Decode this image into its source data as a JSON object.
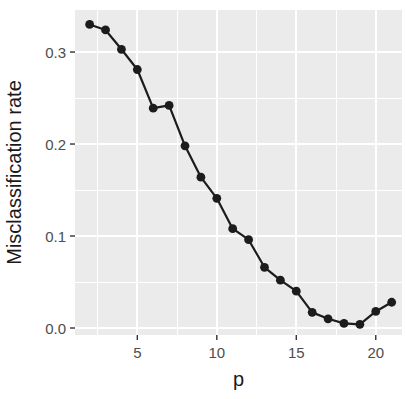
{
  "chart_data": {
    "type": "line",
    "xlabel": "p",
    "ylabel": "Misclassification rate",
    "x": [
      2,
      3,
      4,
      5,
      6,
      7,
      8,
      9,
      10,
      11,
      12,
      13,
      14,
      15,
      16,
      17,
      18,
      19,
      20,
      21
    ],
    "y": [
      0.33,
      0.324,
      0.303,
      0.281,
      0.239,
      0.242,
      0.198,
      0.164,
      0.141,
      0.108,
      0.096,
      0.066,
      0.052,
      0.04,
      0.017,
      0.01,
      0.005,
      0.004,
      0.018,
      0.028
    ],
    "x_ticks": [
      5,
      10,
      15,
      20
    ],
    "x_tick_labels": [
      "5",
      "10",
      "15",
      "20"
    ],
    "y_ticks": [
      0.0,
      0.1,
      0.2,
      0.3
    ],
    "y_tick_labels": [
      "0.0",
      "0.1",
      "0.2",
      "0.3"
    ],
    "x_minor_ticks": [
      2.5,
      7.5,
      12.5,
      17.5
    ],
    "y_minor_ticks": [
      0.05,
      0.15,
      0.25
    ],
    "xlim": [
      1.08,
      21.65
    ],
    "ylim": [
      -0.0076,
      0.3457
    ],
    "grid": "major+minor",
    "legend": "none",
    "marker": "filled-circle",
    "colors": {
      "figure_background": "#FFFFFF",
      "panel_background": "#EBEBEB",
      "grid": "#FFFFFF",
      "line": "#1C1C1C",
      "point": "#1C1C1C",
      "tick_mark": "#333333",
      "tick_label": "#4D4D4D",
      "axis_title": "#1A1A1A"
    }
  }
}
